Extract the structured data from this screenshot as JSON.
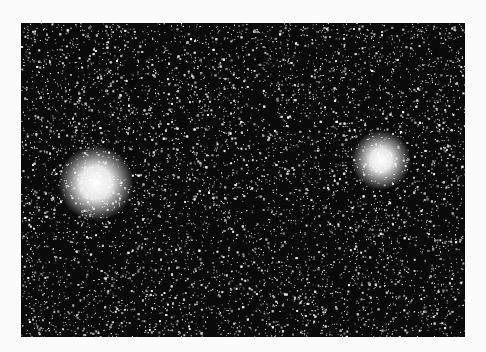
{
  "page": {
    "background": "#fbfbfb"
  },
  "photo": {
    "subject": "star field with two globular clusters",
    "x": 21,
    "y": 23,
    "width": 444,
    "height": 314,
    "sky_color": "#0a0a0a",
    "star_color": "#ffffff",
    "star_density": 9000,
    "seed": 1337
  },
  "clusters": [
    {
      "name": "left-cluster",
      "x": 75,
      "y": 160,
      "radius": 16,
      "glow": 38
    },
    {
      "name": "right-cluster",
      "x": 360,
      "y": 137,
      "radius": 11,
      "glow": 30
    }
  ]
}
